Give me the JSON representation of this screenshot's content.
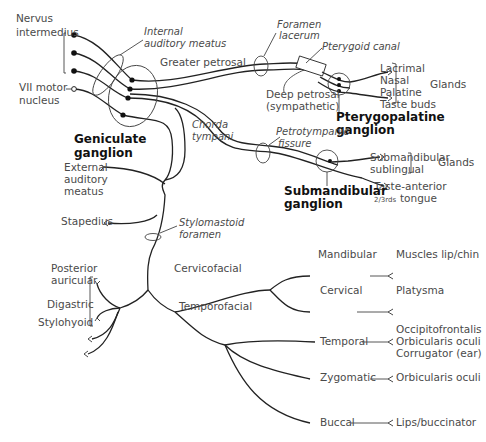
{
  "diagram": {
    "origins": {
      "nervus_intermedius": [
        "Nervus",
        "intermedius"
      ],
      "vii_motor_nucleus": [
        "VII motor",
        "nucleus"
      ]
    },
    "landmarks": {
      "internal_auditory_meatus": [
        "Internal",
        "auditory meatus"
      ],
      "foramen_lacerum": [
        "Foramen",
        "lacerum"
      ],
      "pterygoid_canal": "Pterygoid canal",
      "petrotympanic_fissure": [
        "Petrotympanic",
        "fissure"
      ],
      "stylomastoid_foramen": [
        "Stylomastoid",
        "foramen"
      ],
      "chorda_tympani": [
        "Chorda",
        "tympani"
      ]
    },
    "ganglia": {
      "geniculate": [
        "Geniculate",
        "ganglion"
      ],
      "pterygopalatine": [
        "Pterygopalatine",
        "ganglion"
      ],
      "submandibular": [
        "Submandibular",
        "ganglion"
      ]
    },
    "branches": {
      "greater_petrosal": "Greater petrosal",
      "deep_petrosal": [
        "Deep petrosal",
        "(sympathetic)"
      ],
      "external_auditory_meatus": [
        "External",
        "auditory",
        "meatus"
      ],
      "stapedius": "Stapedius",
      "posterior_auricular": [
        "Posterior",
        "auricular"
      ],
      "digastric": "Digastric",
      "stylohyoid": "Stylohyoid",
      "cervicofacial": "Cervicofacial",
      "temporofacial": "Temporofacial"
    },
    "pterygopalatine_targets": {
      "items": [
        "Lacrimal",
        "Nasal",
        "Palatine",
        "Taste buds"
      ],
      "group_label": "Glands"
    },
    "submandibular_targets": {
      "glands": [
        "Submandibular",
        "sublingual"
      ],
      "group_label": "Glands",
      "taste": [
        "Taste-anterior",
        "tongue"
      ],
      "taste_fraction": "2/3rds"
    },
    "terminal_branches": [
      {
        "name": "Mandibular",
        "targets": [
          "Muscles lip/chin"
        ]
      },
      {
        "name": "Cervical",
        "targets": [
          "Platysma"
        ]
      },
      {
        "name": "Temporal",
        "targets": [
          "Occipitofrontalis",
          "Orbicularis oculi",
          "Corrugator (ear)"
        ]
      },
      {
        "name": "Zygomatic",
        "targets": [
          "Orbicularis oculi"
        ]
      },
      {
        "name": "Buccal",
        "targets": [
          "Lips/buccinator"
        ]
      }
    ]
  }
}
